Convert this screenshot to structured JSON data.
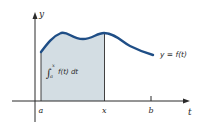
{
  "diagram": {
    "colors": {
      "curve": "#1f4e86",
      "fill": "#d3dde3",
      "axis": "#2a2a2a",
      "text": "#2a2a2a",
      "background": "#ffffff"
    },
    "axes": {
      "x_label": "t",
      "y_label": "y"
    },
    "ticks": {
      "a": "a",
      "x": "x",
      "b": "b"
    },
    "curve_label": "y = f(t)",
    "integral_label": {
      "symbol": "∫",
      "upper": "x",
      "lower": "a",
      "integrand": "f(t) dt"
    }
  }
}
